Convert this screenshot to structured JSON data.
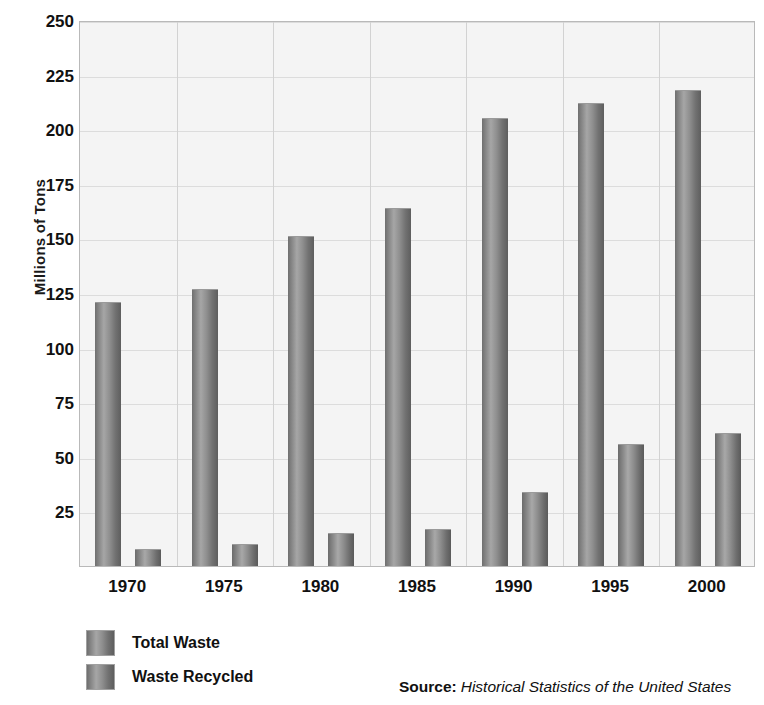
{
  "chart_data": {
    "type": "bar",
    "title": "",
    "xlabel": "",
    "ylabel": "Millions of Tons",
    "categories": [
      "1970",
      "1975",
      "1980",
      "1985",
      "1990",
      "1995",
      "2000"
    ],
    "series": [
      {
        "name": "Total Waste",
        "values": [
          121,
          127,
          151,
          164,
          205,
          212,
          218
        ]
      },
      {
        "name": "Waste Recycled",
        "values": [
          8,
          10,
          15,
          17,
          34,
          56,
          61
        ]
      }
    ],
    "ylim": [
      0,
      250
    ],
    "ytick_labels": [
      "250",
      "225",
      "200",
      "175",
      "150",
      "125",
      "100",
      "75",
      "50",
      "25"
    ],
    "ytick_values": [
      250,
      225,
      200,
      175,
      150,
      125,
      100,
      75,
      50,
      25
    ],
    "grid": true,
    "legend_position": "bottom-left",
    "bar_color": "#8c8c8c",
    "plot_background": "#f4f4f4",
    "gridline_color": "#dcdcdc"
  },
  "axis": {
    "y_title": "Millions of Tons"
  },
  "legend": {
    "items": [
      {
        "label": "Total Waste"
      },
      {
        "label": "Waste Recycled"
      }
    ]
  },
  "source": {
    "label": "Source:",
    "text": "Historical Statistics of the United States"
  }
}
